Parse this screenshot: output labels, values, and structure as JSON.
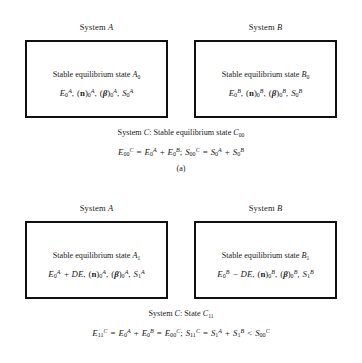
{
  "figure": {
    "title_type": "thermodynamics-system-diagram",
    "panels": [
      {
        "id": "a",
        "label": "(a)",
        "systems": [
          {
            "header_prefix": "System",
            "header_symbol": "A",
            "state_text": "Stable equilibrium state",
            "state_symbol": "A",
            "state_subscript": "0",
            "properties": {
              "energy": {
                "base": "E",
                "sub": "0",
                "sup": "A",
                "extra": ""
              },
              "composition": {
                "base": "n",
                "sub": "0",
                "sup": "A"
              },
              "parameters": {
                "base": "β",
                "sub": "0",
                "sup": "A"
              },
              "entropy": {
                "base": "S",
                "sub": "0",
                "sup": "A"
              }
            }
          },
          {
            "header_prefix": "System",
            "header_symbol": "B",
            "state_text": "Stable equilibrium state",
            "state_symbol": "B",
            "state_subscript": "0",
            "properties": {
              "energy": {
                "base": "E",
                "sub": "0",
                "sup": "B",
                "extra": ""
              },
              "composition": {
                "base": "n",
                "sub": "0",
                "sup": "B"
              },
              "parameters": {
                "base": "β",
                "sub": "0",
                "sup": "B"
              },
              "entropy": {
                "base": "S",
                "sub": "0",
                "sup": "B"
              }
            }
          }
        ],
        "system_c": {
          "title_prefix": "System",
          "title_symbol": "C",
          "title_rest": ": Stable equilibrium state",
          "title_state": "C",
          "title_state_sub": "00",
          "equation_plain": "E₀₀ᶜ = E₀ᴬ + E₀ᴮ ; S₀₀ᶜ = S₀ᴬ + S₀ᴮ"
        }
      },
      {
        "id": "b",
        "label": "(b)",
        "systems": [
          {
            "header_prefix": "System",
            "header_symbol": "A",
            "state_text": "Stable equilibrium state",
            "state_symbol": "A",
            "state_subscript": "1",
            "properties": {
              "energy": {
                "base": "E",
                "sub": "0",
                "sup": "A",
                "extra": "+ DE"
              },
              "composition": {
                "base": "n",
                "sub": "0",
                "sup": "A"
              },
              "parameters": {
                "base": "β",
                "sub": "0",
                "sup": "A"
              },
              "entropy": {
                "base": "S",
                "sub": "1",
                "sup": "A"
              }
            }
          },
          {
            "header_prefix": "System",
            "header_symbol": "B",
            "state_text": "Stable equilibrium state",
            "state_symbol": "B",
            "state_subscript": "1",
            "properties": {
              "energy": {
                "base": "E",
                "sub": "0",
                "sup": "B",
                "extra": "− DE"
              },
              "composition": {
                "base": "n",
                "sub": "0",
                "sup": "B"
              },
              "parameters": {
                "base": "β",
                "sub": "0",
                "sup": "B"
              },
              "entropy": {
                "base": "S",
                "sub": "1",
                "sup": "B"
              }
            }
          }
        ],
        "system_c": {
          "title_prefix": "System",
          "title_symbol": "C",
          "title_rest": ": State",
          "title_state": "C",
          "title_state_sub": "11",
          "equation_plain": "E₁₁ᶜ = E₀ᴬ + E₀ᴮ = E₀₀ᶜ ; S₁₁ᶜ = S₁ᴬ + S₁ᴮ < S₀₀ᶜ"
        }
      }
    ],
    "operators": {
      "equals": "=",
      "plus": "+",
      "minus": "−",
      "less_than": "<",
      "semicolon": ";",
      "comma": ","
    },
    "colors": {
      "border": "#101010",
      "text": "#1a1a1a",
      "background": "#ffffff"
    }
  }
}
